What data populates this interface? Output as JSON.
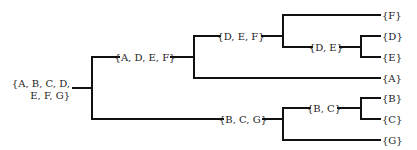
{
  "diagram": {
    "type": "hierarchical-clustering-tree",
    "nodes": {
      "root": {
        "line1": "{A, B, C, D,",
        "line2": "E, F, G}"
      },
      "adef": {
        "label": "{A, D, E, F}"
      },
      "def": {
        "label": "{D, E, F}"
      },
      "de": {
        "label": "{D, E}"
      },
      "bcg": {
        "label": "{B, C, G}"
      },
      "bc": {
        "label": "{B, C}"
      },
      "f": {
        "label": "{F}"
      },
      "d": {
        "label": "{D}"
      },
      "e": {
        "label": "{E}"
      },
      "a": {
        "label": "{A}"
      },
      "b": {
        "label": "{B}"
      },
      "c": {
        "label": "{C}"
      },
      "g": {
        "label": "{G}"
      }
    },
    "edges": [
      [
        "root",
        "adef"
      ],
      [
        "root",
        "bcg"
      ],
      [
        "adef",
        "def"
      ],
      [
        "adef",
        "a"
      ],
      [
        "def",
        "f"
      ],
      [
        "def",
        "de"
      ],
      [
        "de",
        "d"
      ],
      [
        "de",
        "e"
      ],
      [
        "bcg",
        "bc"
      ],
      [
        "bcg",
        "g"
      ],
      [
        "bc",
        "b"
      ],
      [
        "bc",
        "c"
      ]
    ],
    "colors": {
      "line": "#111111",
      "text": "#222222",
      "background": "#ffffff"
    }
  }
}
